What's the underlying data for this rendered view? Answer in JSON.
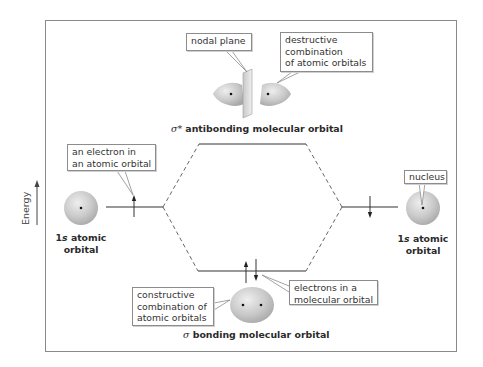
{
  "diagram": {
    "type": "molecular-orbital-energy-diagram",
    "axis": {
      "label": "Energy",
      "direction": "up"
    },
    "antibonding": {
      "symbol": "σ*",
      "caption": "antibonding molecular orbital",
      "callouts": {
        "nodal_plane": "nodal plane",
        "destructive_line1": "destructive",
        "destructive_line2": "combination",
        "destructive_line3": "of atomic orbitals"
      }
    },
    "bonding": {
      "symbol": "σ",
      "caption": "bonding molecular orbital",
      "callouts": {
        "constructive_line1": "constructive",
        "constructive_line2": "combination of",
        "constructive_line3": "atomic orbitals",
        "electrons_line1": "electrons in a",
        "electrons_line2": "molecular orbital"
      },
      "electrons": [
        "up",
        "down"
      ]
    },
    "left_atom": {
      "label_prefix": "1",
      "label_italic": "s",
      "label_suffix": " atomic",
      "label_line2": "orbital",
      "electron": "up",
      "callout_line1": "an electron in",
      "callout_line2": "an atomic orbital"
    },
    "right_atom": {
      "label_prefix": "1",
      "label_italic": "s",
      "label_suffix": " atomic",
      "label_line2": "orbital",
      "electron": "down",
      "callout": "nucleus"
    },
    "colors": {
      "orbital_fill": "#c8c8c8",
      "orbital_highlight": "#ececec",
      "line": "#333333",
      "dashed": "#555555",
      "frame": "#8a8a8a"
    }
  }
}
